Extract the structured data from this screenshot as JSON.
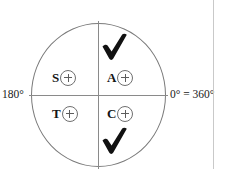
{
  "diagram": {
    "type": "quadrant-circle",
    "center_label": "",
    "axis": {
      "left_label": "180°",
      "right_label": "0° = 360°",
      "top_label": "",
      "bottom_label": ""
    },
    "quadrants": [
      {
        "id": "s",
        "letter": "S",
        "badge": "plus",
        "position": "upper-left",
        "checked": false
      },
      {
        "id": "a",
        "letter": "A",
        "badge": "plus",
        "position": "upper-right",
        "checked": true
      },
      {
        "id": "t",
        "letter": "T",
        "badge": "plus",
        "position": "lower-left",
        "checked": false
      },
      {
        "id": "c",
        "letter": "C",
        "badge": "plus",
        "position": "lower-right",
        "checked": true
      }
    ],
    "checkmarks": [
      {
        "id": "check-upper-right",
        "quadrant": "A",
        "glyph": "check-icon"
      },
      {
        "id": "check-lower-right",
        "quadrant": "C",
        "glyph": "check-icon"
      }
    ],
    "colors": {
      "stroke": "#7a7a7a",
      "axis": "#8a8a8a",
      "text": "#1a1a1a",
      "check": "#111111",
      "edge_rule": "#c9c9c9",
      "background": "#ffffff"
    }
  }
}
